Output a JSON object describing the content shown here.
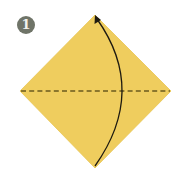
{
  "step": {
    "number": "1"
  },
  "diagram": {
    "paper_color": "#EFCD5E",
    "paper_edge_color": "#E5C04E",
    "fold_line_color": "#6B5A1E",
    "arrow_color": "#1e1a10",
    "badge_color": "#6f7468",
    "shape": "square-on-diagonal",
    "fold": "valley fold along horizontal diagonal",
    "arrow": "bottom corner folded up to top corner"
  }
}
